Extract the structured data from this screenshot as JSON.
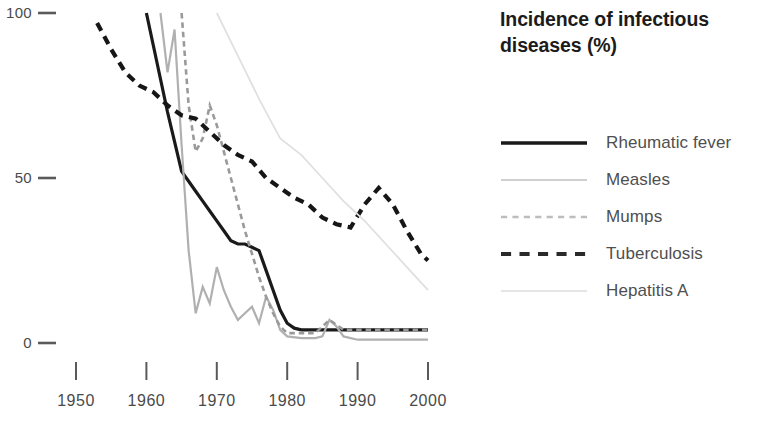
{
  "chart_data": {
    "type": "line",
    "title": "Incidence of infectious diseases (%)",
    "title_line1": "Incidence of infectious",
    "title_line2": "diseases (%)",
    "xlabel": "",
    "ylabel": "",
    "xlim": [
      1947,
      2003
    ],
    "ylim": [
      0,
      100
    ],
    "xticks": [
      "1950",
      "1960",
      "1970",
      "1980",
      "1990",
      "2000"
    ],
    "xtick_values": [
      1950,
      1960,
      1970,
      1980,
      1990,
      2000
    ],
    "yticks": [
      "0",
      "50",
      "100"
    ],
    "ytick_values": [
      0,
      50,
      100
    ],
    "grid": false,
    "legend_position": "right",
    "series": [
      {
        "name": "Rheumatic fever",
        "style": "solid",
        "color": "#1a1a1a",
        "width": 3.2,
        "x": [
          1960,
          1961,
          1962,
          1963,
          1964,
          1965,
          1966,
          1967,
          1968,
          1969,
          1970,
          1971,
          1972,
          1973,
          1974,
          1975,
          1976,
          1977,
          1978,
          1979,
          1980,
          1981,
          1982,
          1984,
          1986,
          1988,
          1990,
          1992,
          1994,
          1996,
          1998,
          2000
        ],
        "y": [
          100,
          90,
          80,
          70,
          61,
          52,
          49,
          46,
          43,
          40,
          37,
          34,
          31,
          30,
          30,
          29,
          28,
          22,
          16,
          10,
          6,
          4.5,
          4,
          4,
          4,
          4,
          4,
          4,
          4,
          4,
          4,
          4
        ]
      },
      {
        "name": "Measles",
        "style": "solid",
        "color": "#b0b0b0",
        "width": 2.2,
        "x": [
          1962,
          1963,
          1964,
          1965,
          1966,
          1967,
          1968,
          1969,
          1970,
          1971,
          1972,
          1973,
          1974,
          1975,
          1976,
          1977,
          1978,
          1979,
          1980,
          1982,
          1984,
          1985,
          1986,
          1987,
          1988,
          1990,
          1992,
          1994,
          1996,
          1998,
          2000
        ],
        "y": [
          100,
          82,
          95,
          60,
          28,
          9,
          17,
          12,
          23,
          16,
          11,
          7,
          9,
          11,
          6,
          14,
          10,
          4,
          2,
          1.5,
          1.5,
          2,
          7,
          5,
          2,
          1,
          1,
          1,
          1,
          1,
          1
        ]
      },
      {
        "name": "Mumps",
        "style": "dashed",
        "color": "#9a9a9a",
        "width": 2.6,
        "x": [
          1965,
          1966,
          1967,
          1968,
          1969,
          1970,
          1971,
          1972,
          1973,
          1974,
          1975,
          1976,
          1977,
          1978,
          1979,
          1980,
          1982,
          1984,
          1986,
          1988,
          1990,
          1992,
          1994,
          1996,
          1998,
          2000
        ],
        "y": [
          100,
          72,
          58,
          62,
          72,
          66,
          58,
          50,
          42,
          34,
          27,
          20,
          14,
          9,
          5,
          3,
          3,
          3,
          7,
          4,
          4,
          4,
          4,
          4,
          4,
          4
        ]
      },
      {
        "name": "Tuberculosis",
        "style": "dashed",
        "color": "#161616",
        "width": 4.2,
        "x": [
          1953,
          1955,
          1957,
          1959,
          1961,
          1963,
          1965,
          1967,
          1969,
          1971,
          1973,
          1975,
          1977,
          1979,
          1981,
          1983,
          1985,
          1987,
          1989,
          1991,
          1993,
          1995,
          1997,
          1999,
          2000
        ],
        "y": [
          97,
          89,
          82,
          78,
          76,
          72,
          69,
          68,
          64,
          60,
          57,
          55,
          50,
          47,
          44,
          42,
          38,
          36,
          35,
          42,
          47,
          42,
          34,
          27,
          25
        ]
      },
      {
        "name": "Hepatitis A",
        "style": "solid",
        "color": "#e0e0e0",
        "width": 1.8,
        "x": [
          1970,
          1973,
          1976,
          1979,
          1982,
          1985,
          1988,
          1991,
          1994,
          1997,
          2000
        ],
        "y": [
          100,
          87,
          74,
          62,
          57,
          50,
          43,
          37,
          30,
          23,
          16
        ]
      }
    ]
  },
  "legend": {
    "title_line1": "Incidence of infectious",
    "title_line2": "diseases (%)",
    "items": [
      {
        "label": "Rheumatic fever",
        "style": "solid",
        "color": "#1a1a1a",
        "width": 3.4,
        "swatch_name": "legend-swatch-rheumatic-fever"
      },
      {
        "label": "Measles",
        "style": "solid",
        "color": "#cfcfcf",
        "width": 1.8,
        "swatch_name": "legend-swatch-measles"
      },
      {
        "label": "Mumps",
        "style": "dashed",
        "color": "#bdbdbd",
        "width": 2.6,
        "swatch_name": "legend-swatch-mumps"
      },
      {
        "label": "Tuberculosis",
        "style": "dashed",
        "color": "#2a2a2a",
        "width": 4.2,
        "swatch_name": "legend-swatch-tuberculosis"
      },
      {
        "label": "Hepatitis A",
        "style": "solid",
        "color": "#dcdcdc",
        "width": 1.5,
        "swatch_name": "legend-swatch-hepatitis-a"
      }
    ]
  }
}
